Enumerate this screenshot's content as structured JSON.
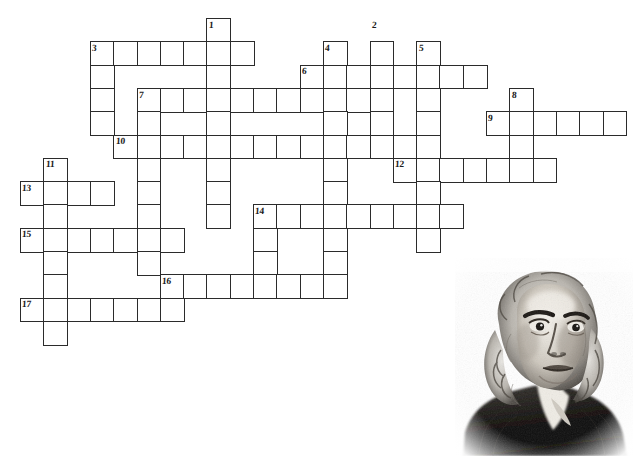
{
  "puzzle": {
    "title": "Benjamin Franklin Crossword Puzzle",
    "cell_size": 23.3,
    "origin_x": 20,
    "origin_y": 18,
    "grid_cols": 27,
    "grid_rows": 19,
    "ink_color": "#2b2b2b",
    "paper_color": "#ffffff",
    "entries": [
      {
        "number": "1",
        "direction": "down",
        "row": 0,
        "col": 8,
        "length": 8
      },
      {
        "number": "2",
        "direction": "down",
        "row": 0,
        "col": 15,
        "length": 7
      },
      {
        "number": "3",
        "direction": "across",
        "row": 1,
        "col": 3,
        "length": 7
      },
      {
        "number": "3",
        "direction": "down",
        "row": 1,
        "col": 3,
        "length": 4
      },
      {
        "number": "4",
        "direction": "down",
        "row": 1,
        "col": 13,
        "length": 6
      },
      {
        "number": "5",
        "direction": "down",
        "row": 1,
        "col": 17,
        "length": 6
      },
      {
        "number": "6",
        "direction": "across",
        "row": 2,
        "col": 12,
        "length": 8
      },
      {
        "number": "7",
        "direction": "across",
        "row": 3,
        "col": 5,
        "length": 11
      },
      {
        "number": "7",
        "direction": "down",
        "row": 3,
        "col": 5,
        "length": 9
      },
      {
        "number": "8",
        "direction": "down",
        "row": 3,
        "col": 21,
        "length": 3
      },
      {
        "number": "9",
        "direction": "across",
        "row": 4,
        "col": 20,
        "length": 6
      },
      {
        "number": "10",
        "direction": "across",
        "row": 5,
        "col": 4,
        "length": 14
      },
      {
        "number": "11",
        "direction": "down",
        "row": 6,
        "col": 1,
        "length": 10
      },
      {
        "number": "12",
        "direction": "across",
        "row": 6,
        "col": 16,
        "length": 7
      },
      {
        "number": "13",
        "direction": "across",
        "row": 7,
        "col": 0,
        "length": 4
      },
      {
        "number": "14",
        "direction": "across",
        "row": 8,
        "col": 10,
        "length": 9
      },
      {
        "number": "14",
        "direction": "down",
        "row": 8,
        "col": 10,
        "length": 4
      },
      {
        "number": "15",
        "direction": "across",
        "row": 9,
        "col": 0,
        "length": 7
      },
      {
        "number": "16",
        "direction": "across",
        "row": 11,
        "col": 6,
        "length": 8
      },
      {
        "number": "17",
        "direction": "across",
        "row": 12,
        "col": 0,
        "length": 6
      }
    ],
    "cells": [
      [
        0,
        8
      ],
      [
        1,
        3
      ],
      [
        1,
        4
      ],
      [
        1,
        5
      ],
      [
        1,
        6
      ],
      [
        1,
        7
      ],
      [
        1,
        8
      ],
      [
        1,
        9
      ],
      [
        1,
        13
      ],
      [
        1,
        15
      ],
      [
        1,
        17
      ],
      [
        2,
        3
      ],
      [
        2,
        8
      ],
      [
        2,
        12
      ],
      [
        2,
        13
      ],
      [
        2,
        14
      ],
      [
        2,
        15
      ],
      [
        2,
        16
      ],
      [
        2,
        17
      ],
      [
        2,
        18
      ],
      [
        2,
        19
      ],
      [
        3,
        3
      ],
      [
        3,
        5
      ],
      [
        3,
        6
      ],
      [
        3,
        7
      ],
      [
        3,
        8
      ],
      [
        3,
        9
      ],
      [
        3,
        10
      ],
      [
        3,
        11
      ],
      [
        3,
        12
      ],
      [
        3,
        13
      ],
      [
        3,
        14
      ],
      [
        3,
        15
      ],
      [
        3,
        17
      ],
      [
        3,
        21
      ],
      [
        4,
        3
      ],
      [
        4,
        5
      ],
      [
        4,
        8
      ],
      [
        4,
        13
      ],
      [
        4,
        15
      ],
      [
        4,
        17
      ],
      [
        4,
        20
      ],
      [
        4,
        21
      ],
      [
        4,
        22
      ],
      [
        4,
        23
      ],
      [
        4,
        24
      ],
      [
        4,
        25
      ],
      [
        5,
        4
      ],
      [
        5,
        5
      ],
      [
        5,
        6
      ],
      [
        5,
        7
      ],
      [
        5,
        8
      ],
      [
        5,
        9
      ],
      [
        5,
        10
      ],
      [
        5,
        11
      ],
      [
        5,
        12
      ],
      [
        5,
        13
      ],
      [
        5,
        14
      ],
      [
        5,
        15
      ],
      [
        5,
        16
      ],
      [
        5,
        17
      ],
      [
        5,
        21
      ],
      [
        6,
        1
      ],
      [
        6,
        5
      ],
      [
        6,
        8
      ],
      [
        6,
        13
      ],
      [
        6,
        16
      ],
      [
        6,
        17
      ],
      [
        6,
        18
      ],
      [
        6,
        19
      ],
      [
        6,
        20
      ],
      [
        6,
        21
      ],
      [
        6,
        22
      ],
      [
        7,
        0
      ],
      [
        7,
        1
      ],
      [
        7,
        2
      ],
      [
        7,
        3
      ],
      [
        7,
        5
      ],
      [
        7,
        8
      ],
      [
        7,
        13
      ],
      [
        7,
        17
      ],
      [
        8,
        1
      ],
      [
        8,
        5
      ],
      [
        8,
        8
      ],
      [
        8,
        10
      ],
      [
        8,
        11
      ],
      [
        8,
        12
      ],
      [
        8,
        13
      ],
      [
        8,
        14
      ],
      [
        8,
        15
      ],
      [
        8,
        16
      ],
      [
        8,
        17
      ],
      [
        8,
        18
      ],
      [
        9,
        0
      ],
      [
        9,
        1
      ],
      [
        9,
        2
      ],
      [
        9,
        3
      ],
      [
        9,
        4
      ],
      [
        9,
        5
      ],
      [
        9,
        6
      ],
      [
        9,
        10
      ],
      [
        9,
        13
      ],
      [
        9,
        17
      ],
      [
        10,
        1
      ],
      [
        10,
        5
      ],
      [
        10,
        10
      ],
      [
        10,
        13
      ],
      [
        11,
        1
      ],
      [
        11,
        6
      ],
      [
        11,
        7
      ],
      [
        11,
        8
      ],
      [
        11,
        9
      ],
      [
        11,
        10
      ],
      [
        11,
        11
      ],
      [
        11,
        12
      ],
      [
        11,
        13
      ],
      [
        12,
        0
      ],
      [
        12,
        1
      ],
      [
        12,
        2
      ],
      [
        12,
        3
      ],
      [
        12,
        4
      ],
      [
        12,
        5
      ],
      [
        12,
        6
      ],
      [
        13,
        1
      ]
    ]
  },
  "portrait": {
    "subject": "Benjamin Franklin",
    "style": "engraving",
    "x": 455,
    "y": 258,
    "width": 178,
    "height": 198
  }
}
